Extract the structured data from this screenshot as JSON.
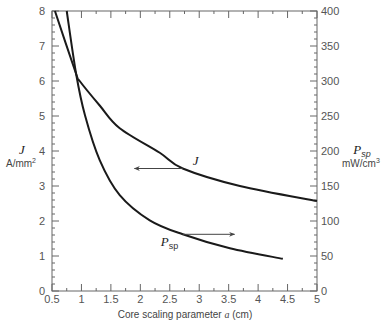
{
  "chart_data": {
    "type": "line",
    "title": "",
    "xlabel": "Core scaling parameter a (cm)",
    "xlabel_prefix": "Core scaling parameter ",
    "xlabel_var": "a",
    "xlabel_suffix": " (cm)",
    "xlim": [
      0.5,
      5
    ],
    "xticks": [
      0.5,
      1,
      1.5,
      2,
      2.5,
      3,
      3.5,
      4,
      4.5,
      5
    ],
    "xtick_labels": [
      "0.5",
      "1",
      "1.5",
      "2",
      "2.5",
      "3",
      "3.5",
      "4",
      "4.5",
      "5"
    ],
    "y_left": {
      "label": "J",
      "unit": "A/mm",
      "unit_sup": "2",
      "ylim": [
        0,
        8
      ],
      "ticks": [
        0,
        1,
        2,
        3,
        4,
        5,
        6,
        7,
        8
      ],
      "tick_labels": [
        "0",
        "1",
        "2",
        "3",
        "4",
        "5",
        "6",
        "7",
        "8"
      ]
    },
    "y_right": {
      "label": "P",
      "label_sub": "sp",
      "unit": "mW/cm",
      "unit_sup": "3",
      "ylim": [
        0,
        400
      ],
      "ticks": [
        0,
        50,
        100,
        150,
        200,
        250,
        300,
        350,
        400
      ],
      "tick_labels": [
        "0",
        "50",
        "100",
        "150",
        "200",
        "250",
        "300",
        "350",
        "400"
      ]
    },
    "grid": false,
    "series": [
      {
        "name": "J",
        "axis": "left",
        "x": [
          0.55,
          0.91,
          0.97,
          1.31,
          1.65,
          2.33,
          2.72,
          3.69,
          5.0
        ],
        "values": [
          8.0,
          6.2,
          6.0,
          5.3,
          4.65,
          3.95,
          3.5,
          3.0,
          2.57
        ],
        "annotation": {
          "text": "J",
          "arrow_direction": "left",
          "arrow_from_x": 2.72,
          "arrow_to_x": 1.9,
          "arrow_y": 3.5
        }
      },
      {
        "name": "Psp",
        "axis": "right",
        "x": [
          0.75,
          0.91,
          1.06,
          1.31,
          1.65,
          2.16,
          2.72,
          3.52,
          4.42
        ],
        "values": [
          400,
          310,
          251,
          187,
          137,
          101,
          81,
          61,
          46
        ],
        "annotation": {
          "text": "Psp",
          "arrow_direction": "right",
          "arrow_from_x": 2.72,
          "arrow_to_x": 3.6,
          "arrow_y": 81
        }
      }
    ],
    "legend": "none (curves labeled inline with arrows pointing to their axes)"
  },
  "labels": {
    "J_curve": "J",
    "Psp_curve_main": "P",
    "Psp_curve_sub": "sp"
  }
}
